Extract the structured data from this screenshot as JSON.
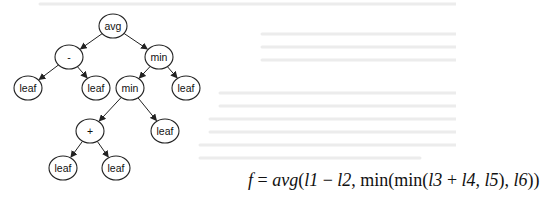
{
  "diagram": {
    "type": "expression-tree",
    "nodes": [
      {
        "id": "n_avg",
        "label": "avg",
        "cx": 113,
        "cy": 26
      },
      {
        "id": "n_sub",
        "label": "-",
        "cx": 69,
        "cy": 57
      },
      {
        "id": "n_min1",
        "label": "min",
        "cx": 159,
        "cy": 57
      },
      {
        "id": "n_l1",
        "label": "leaf",
        "cx": 28,
        "cy": 88
      },
      {
        "id": "n_l2",
        "label": "leaf",
        "cx": 96,
        "cy": 88
      },
      {
        "id": "n_min2",
        "label": "min",
        "cx": 130,
        "cy": 88
      },
      {
        "id": "n_l6",
        "label": "leaf",
        "cx": 186,
        "cy": 88
      },
      {
        "id": "n_add",
        "label": "+",
        "cx": 90,
        "cy": 131
      },
      {
        "id": "n_l5",
        "label": "leaf",
        "cx": 165,
        "cy": 131
      },
      {
        "id": "n_l3",
        "label": "leaf",
        "cx": 63,
        "cy": 168
      },
      {
        "id": "n_l4",
        "label": "leaf",
        "cx": 116,
        "cy": 168
      }
    ],
    "edges": [
      [
        "n_avg",
        "n_sub"
      ],
      [
        "n_avg",
        "n_min1"
      ],
      [
        "n_sub",
        "n_l1"
      ],
      [
        "n_sub",
        "n_l2"
      ],
      [
        "n_min1",
        "n_min2"
      ],
      [
        "n_min1",
        "n_l6"
      ],
      [
        "n_min2",
        "n_add"
      ],
      [
        "n_min2",
        "n_l5"
      ],
      [
        "n_add",
        "n_l3"
      ],
      [
        "n_add",
        "n_l4"
      ]
    ],
    "formula": {
      "lhs": "f",
      "eq": " = ",
      "rhs_parts": [
        {
          "t": "avg",
          "it": true
        },
        {
          "t": "(",
          "it": false
        },
        {
          "t": "l1",
          "it": true
        },
        {
          "t": " − ",
          "it": false
        },
        {
          "t": "l2",
          "it": true
        },
        {
          "t": ", min(min(",
          "it": false
        },
        {
          "t": "l3",
          "it": true
        },
        {
          "t": " + ",
          "it": false
        },
        {
          "t": "l4",
          "it": true
        },
        {
          "t": ", ",
          "it": false
        },
        {
          "t": "l5",
          "it": true
        },
        {
          "t": "), ",
          "it": false
        },
        {
          "t": "l6",
          "it": true
        },
        {
          "t": "))",
          "it": false
        }
      ],
      "text": "f = avg(l1 − l2, min(min(l3 + l4, l5), l6))"
    },
    "colors": {
      "stroke": "#222222",
      "fill": "#ffffff",
      "text": "#111111",
      "ghost": "#e4e4e4"
    }
  }
}
